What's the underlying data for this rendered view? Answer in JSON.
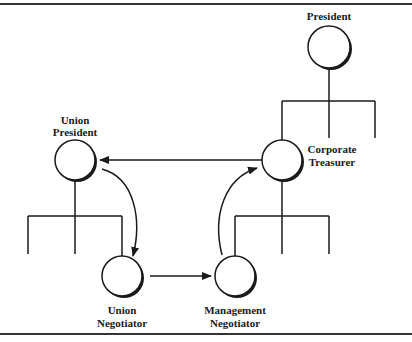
{
  "diagram": {
    "type": "org-chart-communication-flow",
    "colors": {
      "line": "#1a1a1a",
      "background": "#ffffff"
    },
    "nodes": [
      {
        "id": "president",
        "label_lines": [
          "President"
        ]
      },
      {
        "id": "corporate_treasurer",
        "label_lines": [
          "Corporate",
          "Treasurer"
        ]
      },
      {
        "id": "management_negotiator",
        "label_lines": [
          "Management",
          "Negotiator"
        ]
      },
      {
        "id": "union_president",
        "label_lines": [
          "Union",
          "President"
        ]
      },
      {
        "id": "union_negotiator",
        "label_lines": [
          "Union",
          "Negotiator"
        ]
      }
    ],
    "edges": [
      {
        "from": "corporate_treasurer",
        "to": "union_president",
        "style": "straight-arrow"
      },
      {
        "from": "union_president",
        "to": "union_negotiator",
        "style": "curved-arrow"
      },
      {
        "from": "union_negotiator",
        "to": "management_negotiator",
        "style": "straight-arrow"
      },
      {
        "from": "management_negotiator",
        "to": "corporate_treasurer",
        "style": "curved-arrow"
      }
    ]
  }
}
